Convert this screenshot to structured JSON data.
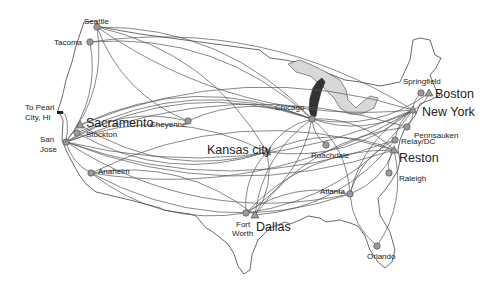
{
  "map": {
    "title": "US network route map",
    "colors": {
      "route": "#555555",
      "node_fill": "#9a9a9a",
      "node_stroke": "#555555",
      "outline": "#444444",
      "lake": "#d8d8d8",
      "lake_dark": "#333333"
    },
    "nodes": [
      {
        "id": "seattle",
        "label": "Seattle",
        "type": "circle",
        "x": 97,
        "y": 27,
        "size": "sm"
      },
      {
        "id": "tacoma",
        "label": "Tacoma",
        "type": "circle",
        "x": 90,
        "y": 42,
        "size": "sm"
      },
      {
        "id": "sacramento",
        "label": "Sacramento",
        "type": "triangle",
        "x": 80,
        "y": 125,
        "size": "lg"
      },
      {
        "id": "stockton",
        "label": "Stockton",
        "type": "circle",
        "x": 77,
        "y": 133,
        "size": "sm"
      },
      {
        "id": "sanjose",
        "label": "San Jose",
        "type": "circle",
        "x": 66,
        "y": 142,
        "size": "sm"
      },
      {
        "id": "anaheim",
        "label": "Anaheim",
        "type": "circle",
        "x": 91,
        "y": 173,
        "size": "sm"
      },
      {
        "id": "cheyenne",
        "label": "Cheyenne",
        "type": "circle",
        "x": 188,
        "y": 121,
        "size": "sm"
      },
      {
        "id": "kansascity",
        "label": "Kansas city",
        "type": "triangle",
        "x": 267,
        "y": 152,
        "size": "lg"
      },
      {
        "id": "chicago",
        "label": "Chicago",
        "type": "circle",
        "x": 312,
        "y": 119,
        "size": "sm"
      },
      {
        "id": "roachdale",
        "label": "Roachdale",
        "type": "circle",
        "x": 326,
        "y": 145,
        "size": "sm"
      },
      {
        "id": "fortworth",
        "label": "Fort Worth",
        "type": "circle",
        "x": 246,
        "y": 213,
        "size": "sm"
      },
      {
        "id": "dallas",
        "label": "Dallas",
        "type": "triangle",
        "x": 255,
        "y": 215,
        "size": "lg"
      },
      {
        "id": "atlanta",
        "label": "Atlanta",
        "type": "circle",
        "x": 350,
        "y": 194,
        "size": "sm"
      },
      {
        "id": "orlando",
        "label": "Orlando",
        "type": "circle",
        "x": 377,
        "y": 246,
        "size": "sm"
      },
      {
        "id": "raleigh",
        "label": "Raleigh",
        "type": "circle",
        "x": 389,
        "y": 173,
        "size": "sm"
      },
      {
        "id": "reston",
        "label": "Reston",
        "type": "triangle",
        "x": 394,
        "y": 150,
        "size": "lg"
      },
      {
        "id": "relaydc",
        "label": "Relay/DC",
        "type": "circle",
        "x": 395,
        "y": 140,
        "size": "sm"
      },
      {
        "id": "pennsauken",
        "label": "Pennsauken",
        "type": "circle",
        "x": 407,
        "y": 127,
        "size": "sm"
      },
      {
        "id": "newyork",
        "label": "New York",
        "type": "triangle",
        "x": 413,
        "y": 110,
        "size": "lg"
      },
      {
        "id": "springfield",
        "label": "Springfield",
        "type": "circle",
        "x": 421,
        "y": 93,
        "size": "sm"
      },
      {
        "id": "boston",
        "label": "Boston",
        "type": "triangle",
        "x": 429,
        "y": 93,
        "size": "lg"
      }
    ],
    "labels": [
      {
        "text": "Seattle",
        "x": 84,
        "y": 18,
        "cls": "sm"
      },
      {
        "text": "Tacoma",
        "x": 54,
        "y": 39,
        "cls": "sm"
      },
      {
        "text": "To Pearl",
        "x": 25,
        "y": 104,
        "cls": "sm"
      },
      {
        "text": "City, HI",
        "x": 25,
        "y": 114,
        "cls": "sm"
      },
      {
        "text": "Sacramento",
        "x": 86,
        "y": 117,
        "cls": "lg"
      },
      {
        "text": "Stockton",
        "x": 86,
        "y": 131,
        "cls": "sm"
      },
      {
        "text": "San",
        "x": 40,
        "y": 136,
        "cls": "sm"
      },
      {
        "text": "Jose",
        "x": 40,
        "y": 146,
        "cls": "sm"
      },
      {
        "text": "Anaheim",
        "x": 98,
        "y": 168,
        "cls": "sm"
      },
      {
        "text": "Cheyenne",
        "x": 150,
        "y": 121,
        "cls": "sm"
      },
      {
        "text": "Kansas city",
        "x": 207,
        "y": 144,
        "cls": "lg"
      },
      {
        "text": "Chicago",
        "x": 275,
        "y": 104,
        "cls": "sm"
      },
      {
        "text": "Roachdale",
        "x": 311,
        "y": 152,
        "cls": "sm"
      },
      {
        "text": "Fort",
        "x": 236,
        "y": 221,
        "cls": "sm"
      },
      {
        "text": "Worth",
        "x": 232,
        "y": 230,
        "cls": "sm"
      },
      {
        "text": "Dallas",
        "x": 256,
        "y": 221,
        "cls": "lg"
      },
      {
        "text": "Atlanta",
        "x": 320,
        "y": 188,
        "cls": "sm"
      },
      {
        "text": "Orlando",
        "x": 367,
        "y": 253,
        "cls": "sm"
      },
      {
        "text": "Raleigh",
        "x": 399,
        "y": 175,
        "cls": "sm"
      },
      {
        "text": "Reston",
        "x": 399,
        "y": 152,
        "cls": "lg"
      },
      {
        "text": "Relay/DC",
        "x": 401,
        "y": 138,
        "cls": "sm"
      },
      {
        "text": "Pennsauken",
        "x": 414,
        "y": 132,
        "cls": "sm"
      },
      {
        "text": "New York",
        "x": 422,
        "y": 106,
        "cls": "lg"
      },
      {
        "text": "Springfield",
        "x": 403,
        "y": 78,
        "cls": "sm"
      },
      {
        "text": "Boston",
        "x": 435,
        "y": 88,
        "cls": "lg"
      }
    ],
    "routes": [
      [
        "seattle",
        "chicago"
      ],
      [
        "seattle",
        "newyork"
      ],
      [
        "seattle",
        "kansascity"
      ],
      [
        "seattle",
        "sanjose"
      ],
      [
        "tacoma",
        "chicago"
      ],
      [
        "tacoma",
        "sanjose"
      ],
      [
        "tacoma",
        "newyork"
      ],
      [
        "sanjose",
        "newyork"
      ],
      [
        "sanjose",
        "chicago"
      ],
      [
        "sanjose",
        "reston"
      ],
      [
        "sanjose",
        "kansascity"
      ],
      [
        "sanjose",
        "atlanta"
      ],
      [
        "sanjose",
        "pennsauken"
      ],
      [
        "sanjose",
        "anaheim"
      ],
      [
        "sanjose",
        "cheyenne"
      ],
      [
        "sanjose",
        "relaydc"
      ],
      [
        "sacramento",
        "chicago"
      ],
      [
        "sacramento",
        "kansascity"
      ],
      [
        "sacramento",
        "newyork"
      ],
      [
        "stockton",
        "kansascity"
      ],
      [
        "stockton",
        "chicago"
      ],
      [
        "anaheim",
        "fortworth"
      ],
      [
        "anaheim",
        "dallas"
      ],
      [
        "anaheim",
        "atlanta"
      ],
      [
        "anaheim",
        "reston"
      ],
      [
        "anaheim",
        "newyork"
      ],
      [
        "cheyenne",
        "chicago"
      ],
      [
        "cheyenne",
        "seattle"
      ],
      [
        "kansascity",
        "fortworth"
      ],
      [
        "kansascity",
        "dallas"
      ],
      [
        "kansascity",
        "chicago"
      ],
      [
        "kansascity",
        "newyork"
      ],
      [
        "kansascity",
        "reston"
      ],
      [
        "chicago",
        "fortworth"
      ],
      [
        "chicago",
        "dallas"
      ],
      [
        "chicago",
        "newyork"
      ],
      [
        "chicago",
        "reston"
      ],
      [
        "chicago",
        "roachdale"
      ],
      [
        "chicago",
        "atlanta"
      ],
      [
        "chicago",
        "boston"
      ],
      [
        "fortworth",
        "atlanta"
      ],
      [
        "fortworth",
        "newyork"
      ],
      [
        "fortworth",
        "reston"
      ],
      [
        "dallas",
        "relaydc"
      ],
      [
        "dallas",
        "pennsauken"
      ],
      [
        "atlanta",
        "orlando"
      ],
      [
        "atlanta",
        "newyork"
      ],
      [
        "atlanta",
        "reston"
      ],
      [
        "atlanta",
        "relaydc"
      ],
      [
        "orlando",
        "reston"
      ],
      [
        "raleigh",
        "reston"
      ],
      [
        "newyork",
        "boston"
      ],
      [
        "newyork",
        "springfield"
      ],
      [
        "newyork",
        "pennsauken"
      ],
      [
        "relaydc",
        "newyork"
      ]
    ]
  }
}
